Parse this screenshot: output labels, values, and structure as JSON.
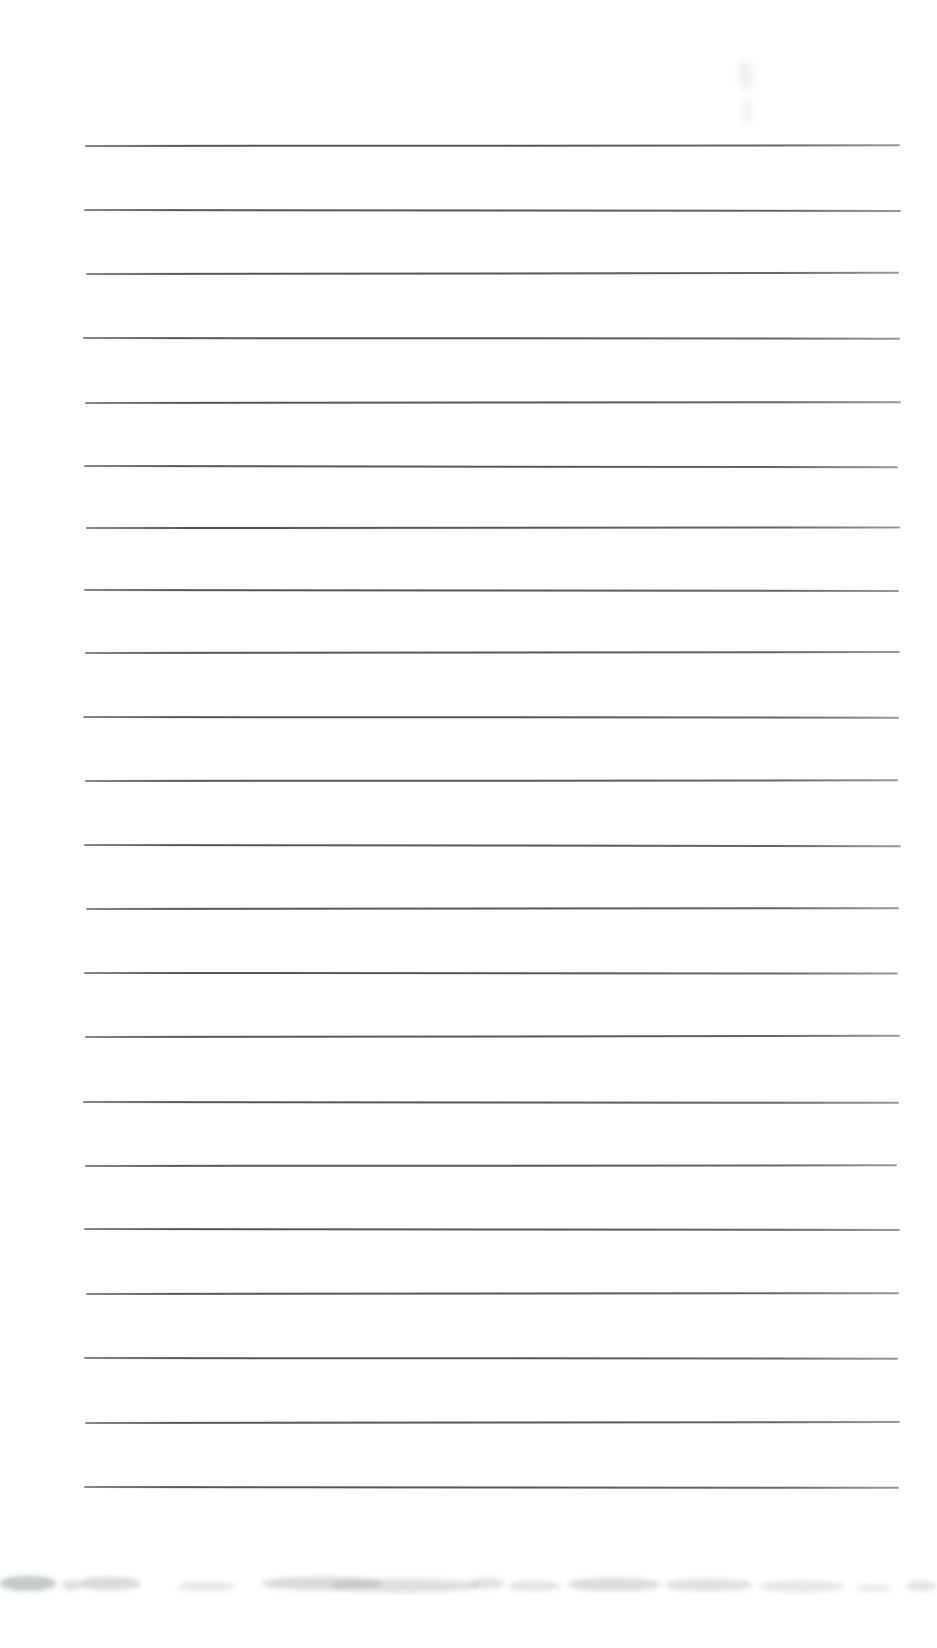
{
  "page": {
    "kind": "scanned-blank-ruled-notebook-page",
    "background_color": "#ffffff",
    "width_px": 937,
    "height_px": 1648
  },
  "ruled_lines": {
    "count": 22,
    "color": "#565656",
    "thickness_px": 2,
    "lines": [
      {
        "y": 145,
        "x1": 85,
        "x2": 900,
        "tilt": -0.05
      },
      {
        "y": 209,
        "x1": 84,
        "x2": 901,
        "tilt": 0.07
      },
      {
        "y": 273,
        "x1": 86,
        "x2": 899,
        "tilt": -0.08
      },
      {
        "y": 337,
        "x1": 83,
        "x2": 900,
        "tilt": 0.05
      },
      {
        "y": 402,
        "x1": 85,
        "x2": 901,
        "tilt": -0.06
      },
      {
        "y": 465,
        "x1": 84,
        "x2": 898,
        "tilt": 0.09
      },
      {
        "y": 527,
        "x1": 86,
        "x2": 900,
        "tilt": -0.04
      },
      {
        "y": 589,
        "x1": 84,
        "x2": 899,
        "tilt": 0.07
      },
      {
        "y": 652,
        "x1": 85,
        "x2": 900,
        "tilt": -0.07
      },
      {
        "y": 716,
        "x1": 83,
        "x2": 899,
        "tilt": 0.05
      },
      {
        "y": 780,
        "x1": 85,
        "x2": 898,
        "tilt": -0.05
      },
      {
        "y": 844,
        "x1": 84,
        "x2": 901,
        "tilt": 0.08
      },
      {
        "y": 908,
        "x1": 86,
        "x2": 899,
        "tilt": -0.06
      },
      {
        "y": 972,
        "x1": 84,
        "x2": 898,
        "tilt": 0.04
      },
      {
        "y": 1036,
        "x1": 85,
        "x2": 900,
        "tilt": -0.08
      },
      {
        "y": 1101,
        "x1": 83,
        "x2": 899,
        "tilt": 0.06
      },
      {
        "y": 1165,
        "x1": 85,
        "x2": 897,
        "tilt": -0.05
      },
      {
        "y": 1228,
        "x1": 84,
        "x2": 900,
        "tilt": 0.07
      },
      {
        "y": 1293,
        "x1": 86,
        "x2": 899,
        "tilt": -0.06
      },
      {
        "y": 1357,
        "x1": 84,
        "x2": 898,
        "tilt": 0.05
      },
      {
        "y": 1422,
        "x1": 85,
        "x2": 900,
        "tilt": -0.07
      },
      {
        "y": 1486,
        "x1": 84,
        "x2": 899,
        "tilt": 0.06
      }
    ]
  },
  "artifacts": {
    "bottom_smudges": [
      {
        "x": 0,
        "y": 1576,
        "w": 56,
        "h": 15,
        "color": "#8e9494",
        "opacity": 0.5
      },
      {
        "x": 62,
        "y": 1580,
        "w": 18,
        "h": 10,
        "color": "#a8a8a8",
        "opacity": 0.35
      },
      {
        "x": 78,
        "y": 1577,
        "w": 62,
        "h": 13,
        "color": "#a0a0a0",
        "opacity": 0.38
      },
      {
        "x": 178,
        "y": 1582,
        "w": 58,
        "h": 9,
        "color": "#b0b0b0",
        "opacity": 0.3
      },
      {
        "x": 262,
        "y": 1577,
        "w": 120,
        "h": 13,
        "color": "#9a9a9a",
        "opacity": 0.36
      },
      {
        "x": 330,
        "y": 1579,
        "w": 150,
        "h": 13,
        "color": "#a2a2a2",
        "opacity": 0.34
      },
      {
        "x": 470,
        "y": 1578,
        "w": 34,
        "h": 11,
        "color": "#a8a8a8",
        "opacity": 0.33
      },
      {
        "x": 508,
        "y": 1581,
        "w": 52,
        "h": 10,
        "color": "#ababab",
        "opacity": 0.32
      },
      {
        "x": 568,
        "y": 1578,
        "w": 92,
        "h": 13,
        "color": "#9e9e9e",
        "opacity": 0.36
      },
      {
        "x": 665,
        "y": 1579,
        "w": 88,
        "h": 12,
        "color": "#a5a5a5",
        "opacity": 0.34
      },
      {
        "x": 760,
        "y": 1581,
        "w": 84,
        "h": 11,
        "color": "#adadad",
        "opacity": 0.3
      },
      {
        "x": 858,
        "y": 1584,
        "w": 32,
        "h": 8,
        "color": "#b3b3b3",
        "opacity": 0.28
      },
      {
        "x": 906,
        "y": 1581,
        "w": 30,
        "h": 10,
        "color": "#a8a8a8",
        "opacity": 0.32
      }
    ],
    "top_right_ghost_marks": [
      {
        "x": 738,
        "y": 60,
        "w": 16,
        "h": 30,
        "color": "#eef1f1",
        "opacity": 0.85
      },
      {
        "x": 741,
        "y": 98,
        "w": 12,
        "h": 26,
        "color": "#f1f3f3",
        "opacity": 0.85
      }
    ]
  }
}
